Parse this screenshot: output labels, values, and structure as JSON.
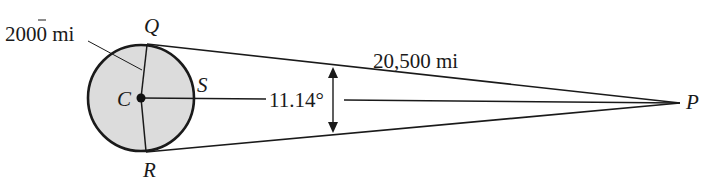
{
  "diagram": {
    "points": {
      "C": "C",
      "Q": "Q",
      "R": "R",
      "S": "S",
      "P": "P"
    },
    "labels": {
      "radius": "2000 mi",
      "distance": "20,500 mi",
      "angle": "11.14°"
    },
    "colors": {
      "circle_fill": "#dcdcdc",
      "stroke": "#1a1a1a"
    }
  }
}
